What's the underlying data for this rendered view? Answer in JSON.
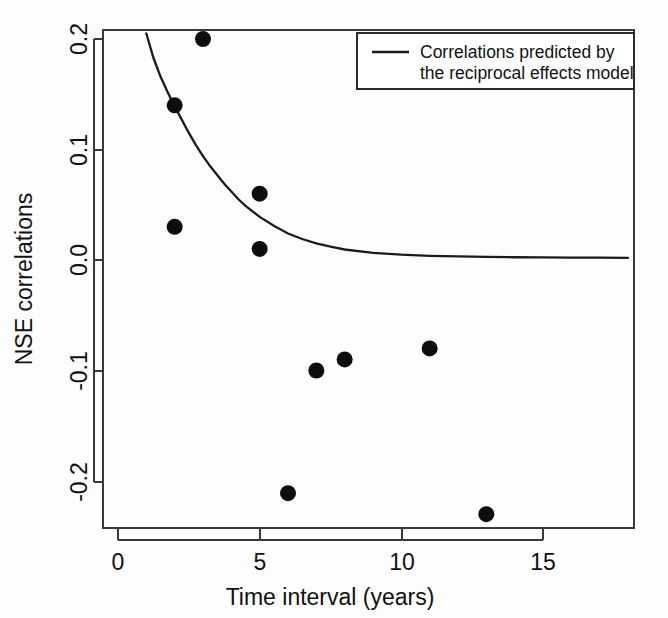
{
  "chart_data": {
    "type": "scatter",
    "title": "",
    "xlabel": "Time interval (years)",
    "ylabel": "NSE correlations",
    "xlim": [
      -0.6,
      18.2
    ],
    "ylim": [
      -0.248,
      0.215
    ],
    "xticks": [
      0,
      5,
      10,
      15
    ],
    "xtick_labels": [
      "0",
      "5",
      "10",
      "15"
    ],
    "yticks": [
      0.2,
      0.1,
      0.0,
      -0.1,
      -0.2
    ],
    "ytick_labels": [
      "0.2",
      "0.1",
      "0.0",
      "-0.1",
      "-0.2"
    ],
    "grid": false,
    "legend_position": "top-right",
    "series": [
      {
        "name": "NSE correlations (observed)",
        "type": "scatter",
        "marker": "filled-circle",
        "color": "#0d0d0d",
        "points": [
          {
            "x": 2,
            "y": 0.14
          },
          {
            "x": 2,
            "y": 0.03
          },
          {
            "x": 3,
            "y": 0.2
          },
          {
            "x": 5,
            "y": 0.06
          },
          {
            "x": 5,
            "y": 0.01
          },
          {
            "x": 6,
            "y": -0.211
          },
          {
            "x": 7,
            "y": -0.1
          },
          {
            "x": 8,
            "y": -0.09
          },
          {
            "x": 11,
            "y": -0.08
          },
          {
            "x": 13,
            "y": -0.23
          }
        ]
      },
      {
        "name": "Correlations predicted by the reciprocal effects model",
        "type": "line",
        "color": "#1b1b1b",
        "x_start": 1,
        "x_end": 18,
        "y_start": 0.205,
        "y_asymptote": 0.002,
        "points": [
          {
            "x": 1.0,
            "y": 0.205
          },
          {
            "x": 1.25,
            "y": 0.183
          },
          {
            "x": 1.5,
            "y": 0.166
          },
          {
            "x": 1.75,
            "y": 0.152
          },
          {
            "x": 2.0,
            "y": 0.139
          },
          {
            "x": 2.25,
            "y": 0.127
          },
          {
            "x": 2.5,
            "y": 0.115
          },
          {
            "x": 2.75,
            "y": 0.104
          },
          {
            "x": 3.0,
            "y": 0.094
          },
          {
            "x": 3.25,
            "y": 0.085
          },
          {
            "x": 3.5,
            "y": 0.077
          },
          {
            "x": 3.75,
            "y": 0.069
          },
          {
            "x": 4.0,
            "y": 0.062
          },
          {
            "x": 4.25,
            "y": 0.055
          },
          {
            "x": 4.5,
            "y": 0.049
          },
          {
            "x": 4.75,
            "y": 0.044
          },
          {
            "x": 5.0,
            "y": 0.039
          },
          {
            "x": 5.5,
            "y": 0.031
          },
          {
            "x": 6.0,
            "y": 0.024
          },
          {
            "x": 6.5,
            "y": 0.019
          },
          {
            "x": 7.0,
            "y": 0.015
          },
          {
            "x": 7.5,
            "y": 0.012
          },
          {
            "x": 8.0,
            "y": 0.0095
          },
          {
            "x": 9.0,
            "y": 0.0065
          },
          {
            "x": 10.0,
            "y": 0.0048
          },
          {
            "x": 11.0,
            "y": 0.0038
          },
          {
            "x": 12.0,
            "y": 0.0032
          },
          {
            "x": 13.0,
            "y": 0.0028
          },
          {
            "x": 14.0,
            "y": 0.0025
          },
          {
            "x": 15.0,
            "y": 0.0023
          },
          {
            "x": 16.0,
            "y": 0.0022
          },
          {
            "x": 17.0,
            "y": 0.0021
          },
          {
            "x": 18.0,
            "y": 0.002
          }
        ]
      }
    ],
    "legend": [
      {
        "label_line_1": "Correlations predicted by",
        "label_line_2": "the reciprocal effects model",
        "marker": "line",
        "color": "#1b1b1b"
      }
    ]
  },
  "axes": {
    "x_title": "Time interval (years)",
    "y_title": "NSE correlations"
  },
  "colors": {
    "background": "#fdfdfd",
    "frame": "#3a3a3a",
    "point": "#0d0d0d",
    "curve": "#1b1b1b",
    "text": "#111111"
  }
}
